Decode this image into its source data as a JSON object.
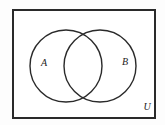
{
  "diagram": {
    "type": "venn",
    "labels": {
      "set_a": "A",
      "set_b": "B",
      "universal": "U"
    },
    "colors": {
      "stroke": "#2a2a2a",
      "fill": "#ffffff"
    }
  }
}
